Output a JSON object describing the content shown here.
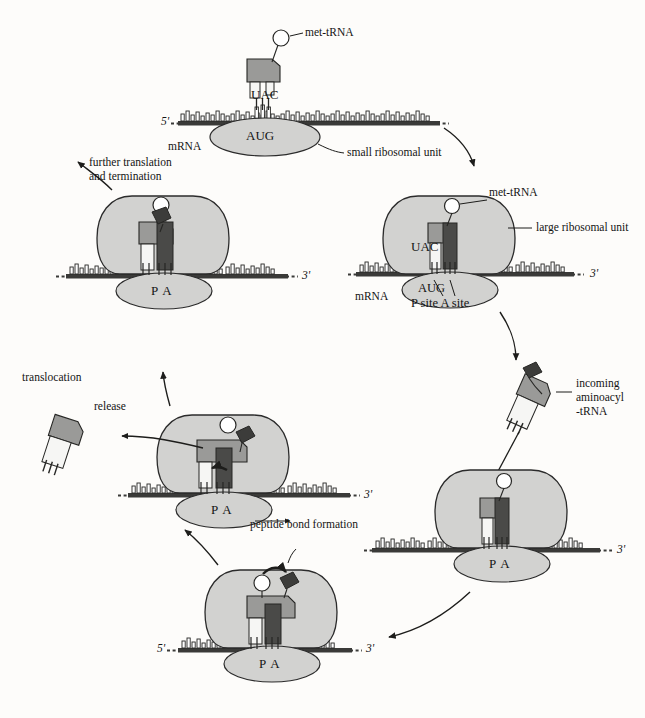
{
  "diagram": {
    "type": "biology-process-cycle",
    "colors": {
      "ribosome_fill": "#d2d2d0",
      "ribosome_stroke": "#2b2b2b",
      "trna_p_head": "#9a9a98",
      "trna_a_body": "#4a4a48",
      "trna_stem_white": "#f4f4f2",
      "mrna_bar": "#3a3a38",
      "base_fill": "#ffffff",
      "amino_acid_dark": "#3c3c3a",
      "background": "#fdfcfa"
    }
  },
  "labels": {
    "met_trna_top": "met-tRNA",
    "uac_top": "UAC",
    "aug_top": "AUG",
    "five_prime_top": "5'",
    "mrna_top": "mRNA",
    "small_ribosomal_unit": "small ribosomal unit",
    "met_trna_right": "met-tRNA",
    "large_ribosomal_unit": "large ribosomal unit",
    "uac_right": "UAC",
    "aug_right": "AUG",
    "p_site_a_site": "P site A site",
    "mrna_right": "mRNA",
    "three_prime_right": "3'",
    "incoming_line1": "incoming",
    "incoming_line2": "aminoacyl",
    "incoming_line3": "-tRNA",
    "three_prime_incoming": "3'",
    "pa_incoming": "P A",
    "peptide_bond_formation": "peptide bond formation",
    "five_prime_bottom": "5'",
    "three_prime_bottom": "3'",
    "pa_bottom": "P A",
    "translocation": "translocation",
    "release": "release",
    "three_prime_release": "3'",
    "pa_release": "P A",
    "further_line1": "further translation",
    "further_line2": "and termination",
    "three_prime_further": "3'",
    "pa_further": "P A"
  },
  "steps": [
    {
      "id": "initiation",
      "label": "small ribosomal unit binds mRNA with met-tRNA at AUG"
    },
    {
      "id": "large-subunit-join",
      "label": "large ribosomal unit joins; P site and A site formed"
    },
    {
      "id": "aminoacyl-entry",
      "label": "incoming aminoacyl-tRNA enters A site"
    },
    {
      "id": "peptide-bond",
      "label": "peptide bond formation"
    },
    {
      "id": "release-translocation",
      "label": "uncharged tRNA release and translocation"
    },
    {
      "id": "elongation-termination",
      "label": "further translation and termination"
    }
  ]
}
